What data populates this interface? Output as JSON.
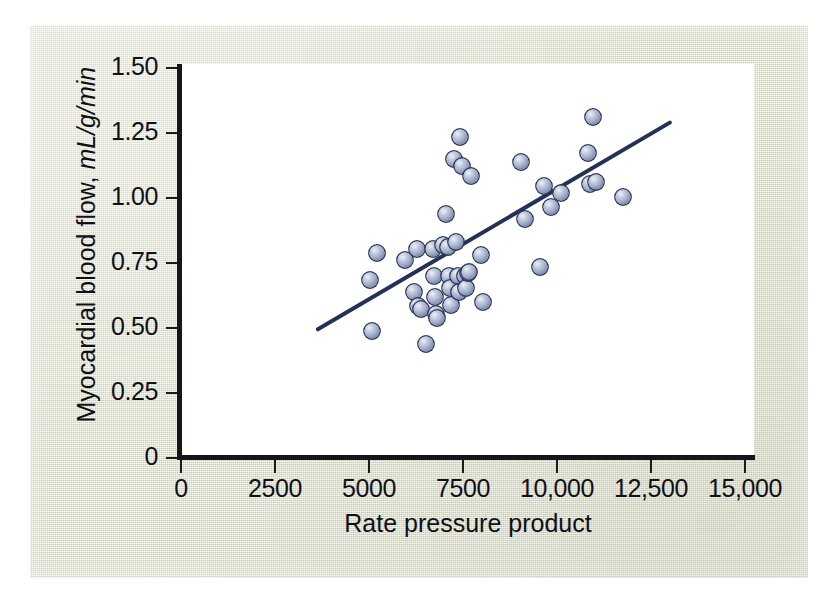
{
  "figure": {
    "background_color": "#dde0ce",
    "plot_background_color": "#ffffff",
    "axis_color": "#15151a",
    "marker_color": "#a2aec9",
    "marker_edge_color": "#2e3a5e",
    "line_color": "#22305a"
  },
  "chart_data": {
    "type": "scatter",
    "title": "",
    "xlabel": "Rate pressure product",
    "ylabel_prefix": "Myocardial blood flow, ",
    "ylabel_units": "mL/g/min",
    "ylabel": "Myocardial blood flow, mL/g/min",
    "xlim": [
      0,
      15000
    ],
    "ylim": [
      0,
      1.5
    ],
    "grid": false,
    "legend": null,
    "xticks": [
      0,
      2500,
      5000,
      7500,
      10000,
      12500,
      15000
    ],
    "xticklabels": [
      "0",
      "2500",
      "5000",
      "7500",
      "10,000",
      "12,500",
      "15,000"
    ],
    "yticks": [
      0,
      0.25,
      0.5,
      0.75,
      1.0,
      1.25,
      1.5
    ],
    "yticklabels": [
      "0",
      "0.25",
      "0.50",
      "0.75",
      "1.00",
      "1.25",
      "1.50"
    ],
    "series": [
      {
        "name": "Myocardial blood flow vs rate pressure product",
        "marker": "sphere",
        "points": [
          [
            5020,
            0.685
          ],
          [
            5080,
            0.49
          ],
          [
            5200,
            0.79
          ],
          [
            5960,
            0.76
          ],
          [
            6200,
            0.64
          ],
          [
            6280,
            0.805
          ],
          [
            6300,
            0.585
          ],
          [
            6380,
            0.575
          ],
          [
            6520,
            0.44
          ],
          [
            6700,
            0.805
          ],
          [
            6740,
            0.7
          ],
          [
            6760,
            0.62
          ],
          [
            6780,
            0.555
          ],
          [
            6800,
            0.54
          ],
          [
            6980,
            0.82
          ],
          [
            7060,
            0.94
          ],
          [
            7100,
            0.81
          ],
          [
            7140,
            0.7
          ],
          [
            7160,
            0.655
          ],
          [
            7180,
            0.59
          ],
          [
            7260,
            1.15
          ],
          [
            7320,
            0.83
          ],
          [
            7360,
            0.7
          ],
          [
            7400,
            0.64
          ],
          [
            7420,
            1.235
          ],
          [
            7480,
            1.125
          ],
          [
            7560,
            0.7
          ],
          [
            7580,
            0.655
          ],
          [
            7620,
            0.71
          ],
          [
            7660,
            0.715
          ],
          [
            7700,
            1.085
          ],
          [
            7980,
            0.78
          ],
          [
            8040,
            0.6
          ],
          [
            9040,
            1.14
          ],
          [
            9160,
            0.92
          ],
          [
            9560,
            0.735
          ],
          [
            9660,
            1.045
          ],
          [
            9840,
            0.965
          ],
          [
            10100,
            1.02
          ],
          [
            10820,
            1.175
          ],
          [
            10880,
            1.055
          ],
          [
            10960,
            1.31
          ],
          [
            11040,
            1.06
          ],
          [
            11760,
            1.005
          ]
        ]
      }
    ],
    "fit_line": {
      "name": "least-squares regression line",
      "x_start": 3640,
      "y_start": 0.495,
      "x_end": 13000,
      "y_end": 1.29
    }
  }
}
